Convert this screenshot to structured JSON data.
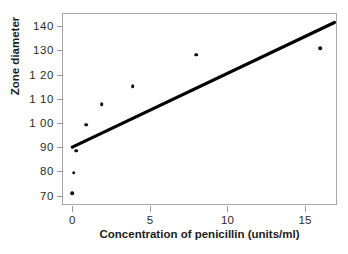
{
  "chart_data": {
    "type": "scatter",
    "title": "",
    "xlabel": "Concentration of penicillin (units/ml)",
    "ylabel": "Zone diameter",
    "xlim": [
      -0.6,
      17.0
    ],
    "ylim": [
      66.5,
      145.0
    ],
    "xticks": [
      0,
      5,
      10,
      15
    ],
    "yticks": [
      70,
      80,
      90,
      100,
      110,
      120,
      130,
      140
    ],
    "xtick_labels": [
      "0",
      "5",
      "10",
      "15"
    ],
    "ytick_labels": [
      "70",
      "80",
      "90",
      "1 00",
      "1 10",
      "1 20",
      "130",
      "140"
    ],
    "grid": false,
    "legend": false,
    "points": [
      {
        "x": 0.0,
        "y": 71.0
      },
      {
        "x": 0.1,
        "y": 79.5
      },
      {
        "x": 0.25,
        "y": 88.5
      },
      {
        "x": 0.9,
        "y": 99.2
      },
      {
        "x": 1.9,
        "y": 107.8
      },
      {
        "x": 3.9,
        "y": 115.2
      },
      {
        "x": 8.0,
        "y": 128.2
      },
      {
        "x": 16.0,
        "y": 130.8
      }
    ],
    "series": [
      {
        "name": "observed",
        "x": [
          0.0,
          0.1,
          0.25,
          0.9,
          1.9,
          3.9,
          8.0,
          16.0
        ],
        "values": [
          71.0,
          79.5,
          88.5,
          99.2,
          107.8,
          115.2,
          128.2,
          130.8
        ]
      }
    ],
    "fit_line": {
      "name": "regression-line",
      "x_start": 0.0,
      "y_start": 90.0,
      "x_end": 16.9,
      "y_end": 141.5
    },
    "colors": {
      "point": "#111111",
      "line": "#000000",
      "frame": "#a8a8a8",
      "background": "#ffffff",
      "text": "#1c1c1c"
    }
  }
}
